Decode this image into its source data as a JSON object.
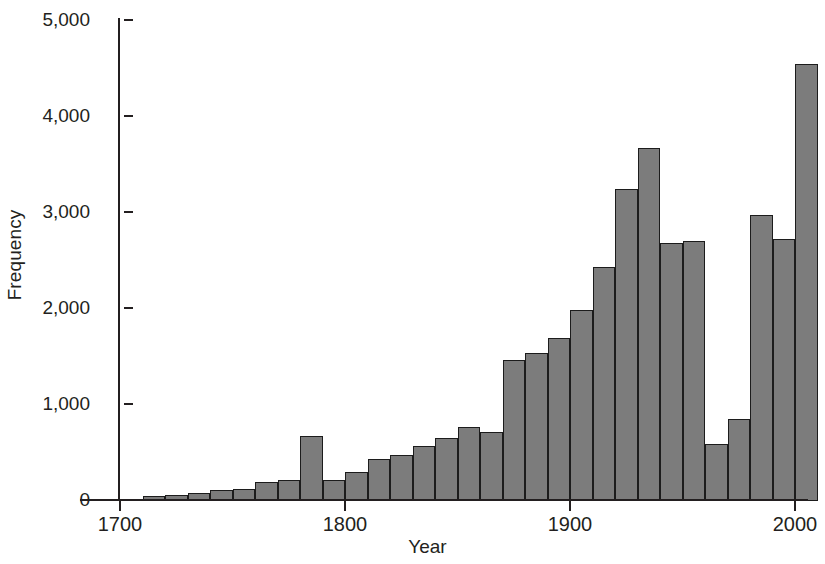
{
  "chart_data": {
    "type": "bar",
    "title": "",
    "subtitle": "",
    "xlabel": "Year",
    "ylabel": "Frequency",
    "xlim": [
      1695,
      2005
    ],
    "ylim": [
      0,
      5000
    ],
    "grid": false,
    "legend": null,
    "bin_width": 10,
    "x_tick_labels": [
      "1700",
      "1800",
      "1900",
      "2000"
    ],
    "x_ticks": [
      1700,
      1800,
      1900,
      2000
    ],
    "y_tick_labels": [
      "0",
      "1,000",
      "2,000",
      "3,000",
      "4,000",
      "5,000"
    ],
    "y_ticks": [
      0,
      1000,
      2000,
      3000,
      4000,
      5000
    ],
    "categories": [
      1700,
      1710,
      1720,
      1730,
      1740,
      1750,
      1760,
      1770,
      1780,
      1790,
      1800,
      1810,
      1820,
      1830,
      1840,
      1850,
      1860,
      1870,
      1880,
      1890,
      1900,
      1910,
      1920,
      1930,
      1940,
      1950,
      1960,
      1970,
      1980,
      1990,
      2000
    ],
    "values": [
      10,
      50,
      60,
      80,
      115,
      125,
      195,
      215,
      680,
      220,
      300,
      440,
      480,
      575,
      660,
      775,
      720,
      1470,
      1540,
      1700,
      1985,
      2435,
      3255,
      3680,
      2690,
      2705,
      590,
      850,
      2980,
      2725,
      4555
    ],
    "bar_color": "#7c7c7c",
    "bar_edge_color": "#1c1c1c",
    "axis_color": "#231f20",
    "background_color": "#ffffff"
  },
  "axes": {
    "y_title": "Frequency",
    "x_title": "Year"
  }
}
